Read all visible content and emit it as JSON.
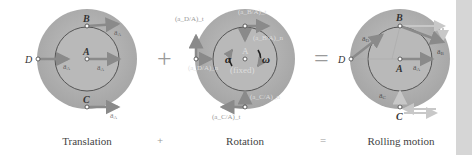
{
  "figure": {
    "panels": [
      {
        "id": "translation",
        "caption": "Translation",
        "points": {
          "A": "A",
          "B": "B",
          "C": "C",
          "D": "D"
        },
        "vectors": {
          "B": "a_A",
          "A": "a_A",
          "D": "a_A",
          "C": "a_A"
        }
      },
      {
        "id": "rotation",
        "caption": "Rotation",
        "center_label": "A",
        "center_note": "(fixed)",
        "alpha": "α",
        "omega": "ω",
        "vectors": {
          "D_t": "(a_D/A)_t",
          "D_n": "(a_D/A)_n",
          "B_t": "(a_B/A)_t",
          "B_n": "(a_B/A)_n",
          "C_n": "(a_C/A)_n",
          "C_t": "(a_C/A)_t"
        }
      },
      {
        "id": "rolling",
        "caption": "Rolling motion",
        "points": {
          "A": "A",
          "B": "B",
          "C": "C",
          "D": "D"
        },
        "vectors": {
          "D": "a_D",
          "B": "a_B",
          "A": "a_A",
          "C": "a_C"
        }
      }
    ],
    "operators": {
      "plus": "+",
      "equals": "=",
      "plus_small": "+",
      "equals_small": "="
    },
    "colors": {
      "disk_outer": "#a9a9a9",
      "disk_inner": "#b9b9b9",
      "rim": "#555555",
      "vector": "#8a8a8a",
      "vector_light": "#c8c8c8",
      "label": "#555555",
      "strip": "#d6d6d6"
    }
  }
}
